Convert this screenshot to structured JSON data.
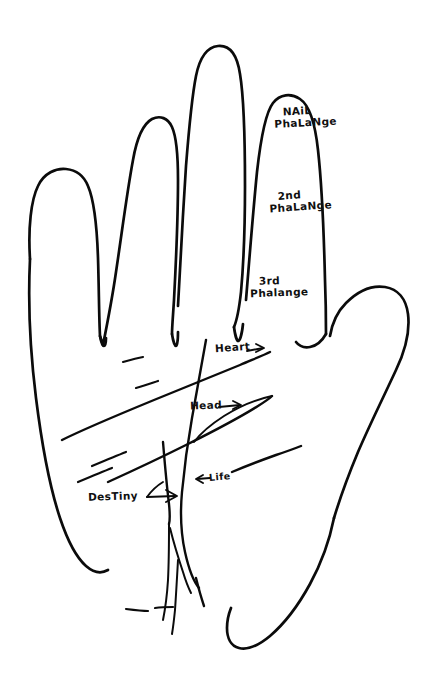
{
  "figure": {
    "background_color": "#ffffff",
    "ink_color": "#0b0b0b"
  },
  "finger_labels": [
    {
      "id": "nail-phalange",
      "line1": "NAiL",
      "line2": "PhaLaNge",
      "target": "index-finger-distal"
    },
    {
      "id": "second-phalange",
      "line1": "2nd",
      "line2": "PhaLaNge",
      "target": "index-finger-middle"
    },
    {
      "id": "third-phalange",
      "line1": "3rd",
      "line2": "Phalange",
      "target": "index-finger-proximal"
    }
  ],
  "palm_lines": [
    {
      "id": "heart-line",
      "label": "Heart",
      "arrow": "right",
      "arrow_glyph": "→"
    },
    {
      "id": "head-line",
      "label": "Head",
      "arrow": "right",
      "arrow_glyph": "→"
    },
    {
      "id": "life-line",
      "label": "Life",
      "arrow": "left",
      "arrow_glyph": "←"
    },
    {
      "id": "destiny-line",
      "label": "DesTiny",
      "arrow": "right",
      "arrow_glyph": "→"
    }
  ]
}
